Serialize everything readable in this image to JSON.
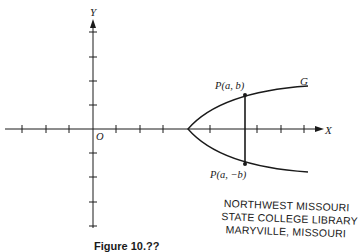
{
  "figure": {
    "axes": {
      "x_label": "X",
      "y_label": "Y",
      "origin_label": "O"
    },
    "curve": {
      "name": "G",
      "type": "parabola opening right, symmetric about X axis"
    },
    "points": [
      {
        "label": "P(a, b)",
        "position": "upper"
      },
      {
        "label": "P(a, −b)",
        "position": "lower"
      }
    ],
    "stamp": {
      "lines": [
        "NORTHWEST MISSOURI",
        "STATE COLLEGE LIBRARY",
        "MARYVILLE, MISSOURI"
      ]
    },
    "caption": "Figure 10.??"
  }
}
